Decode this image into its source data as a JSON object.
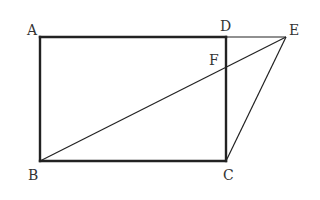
{
  "diagram": {
    "type": "geometry",
    "points": {
      "A": {
        "label": "A",
        "x": 40,
        "y": 37
      },
      "B": {
        "label": "B",
        "x": 40,
        "y": 161
      },
      "C": {
        "label": "C",
        "x": 226,
        "y": 161
      },
      "D": {
        "label": "D",
        "x": 226,
        "y": 37
      },
      "E": {
        "label": "E",
        "x": 286,
        "y": 37
      },
      "F": {
        "label": "F",
        "x": 226,
        "y": 68
      }
    },
    "segments": [
      {
        "from": "A",
        "to": "D",
        "style": "thick"
      },
      {
        "from": "A",
        "to": "B",
        "style": "thick"
      },
      {
        "from": "B",
        "to": "C",
        "style": "thick"
      },
      {
        "from": "D",
        "to": "C",
        "style": "thick"
      },
      {
        "from": "D",
        "to": "E",
        "style": "thin"
      },
      {
        "from": "B",
        "to": "E",
        "style": "thin"
      },
      {
        "from": "C",
        "to": "E",
        "style": "thin"
      }
    ],
    "labels": {
      "A": "A",
      "B": "B",
      "C": "C",
      "D": "D",
      "E": "E",
      "F": "F"
    },
    "stroke_color": "#222222",
    "label_color": "#333333"
  }
}
